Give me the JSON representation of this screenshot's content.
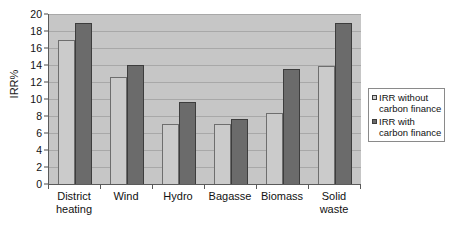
{
  "chart_data": {
    "type": "bar",
    "title": "",
    "xlabel": "",
    "ylabel": "IRR%",
    "ylim": [
      0,
      20
    ],
    "ytick_step": 2,
    "yticks": [
      20,
      18,
      16,
      14,
      12,
      10,
      8,
      6,
      4,
      2,
      0
    ],
    "grid": true,
    "legend_position": "right",
    "categories": [
      "District heating",
      "Wind",
      "Hydro",
      "Bagasse",
      "Biomass",
      "Solid waste"
    ],
    "category_lines": [
      [
        "District",
        "heating"
      ],
      [
        "Wind",
        ""
      ],
      [
        "Hydro",
        ""
      ],
      [
        "Bagasse",
        ""
      ],
      [
        "Biomass",
        ""
      ],
      [
        "Solid",
        "waste"
      ]
    ],
    "series": [
      {
        "name": "IRR without carbon finance",
        "name_lines": [
          "IRR without",
          "carbon finance"
        ],
        "color": "#cbcbcb",
        "values": [
          16.9,
          12.6,
          7.1,
          7.1,
          8.3,
          13.9
        ]
      },
      {
        "name": "IRR with carbon finance",
        "name_lines": [
          "IRR with",
          "carbon finance"
        ],
        "color": "#6b6b6b",
        "values": [
          19.0,
          14.0,
          9.7,
          7.6,
          13.5,
          18.9
        ]
      }
    ]
  },
  "colors": {
    "plot_background": "#c6c6c6",
    "gridline": "#a8a8a8",
    "axis": "#5a5a5a",
    "page_background": "#ffffff",
    "text": "#111111",
    "series_light": "#cbcbcb",
    "series_dark": "#6b6b6b"
  }
}
